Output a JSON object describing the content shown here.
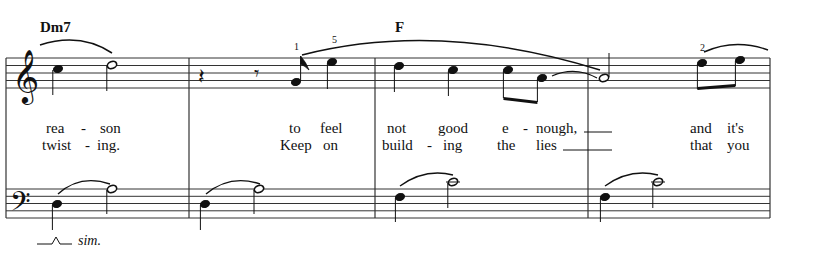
{
  "chords": [
    {
      "label": "Dm7",
      "x": 40,
      "y": 19
    },
    {
      "label": "F",
      "x": 395,
      "y": 19
    }
  ],
  "fingerings": [
    {
      "label": "1",
      "x": 294,
      "y": 41
    },
    {
      "label": "5",
      "x": 332,
      "y": 34
    },
    {
      "label": "2",
      "x": 700,
      "y": 42
    }
  ],
  "lyrics": {
    "verse1": [
      {
        "text": "rea",
        "x": 46
      },
      {
        "text": "-",
        "x": 81
      },
      {
        "text": "son",
        "x": 100
      },
      {
        "text": "to",
        "x": 289
      },
      {
        "text": "feel",
        "x": 320
      },
      {
        "text": "not",
        "x": 387
      },
      {
        "text": "good",
        "x": 438
      },
      {
        "text": "e",
        "x": 502
      },
      {
        "text": "-",
        "x": 523
      },
      {
        "text": "nough,",
        "x": 536
      },
      {
        "text": "and",
        "x": 690
      },
      {
        "text": "it's",
        "x": 727
      }
    ],
    "verse2": [
      {
        "text": "twist",
        "x": 42
      },
      {
        "text": "-",
        "x": 85
      },
      {
        "text": "ing.",
        "x": 97
      },
      {
        "text": "Keep",
        "x": 280
      },
      {
        "text": "on",
        "x": 323
      },
      {
        "text": "build",
        "x": 382
      },
      {
        "text": "-",
        "x": 427
      },
      {
        "text": "ing",
        "x": 443
      },
      {
        "text": "the",
        "x": 497
      },
      {
        "text": "lies",
        "x": 536
      },
      {
        "text": "that",
        "x": 690
      },
      {
        "text": "you",
        "x": 727
      }
    ]
  },
  "annotations": {
    "simile": "sim."
  },
  "measures": [
    {
      "number": 1,
      "chord": "Dm7"
    },
    {
      "number": 2,
      "chord": ""
    },
    {
      "number": 3,
      "chord": "F"
    },
    {
      "number": 4,
      "chord": ""
    }
  ],
  "colors": {
    "ink": "#111111",
    "staff": "#333333",
    "paper": "#ffffff"
  }
}
